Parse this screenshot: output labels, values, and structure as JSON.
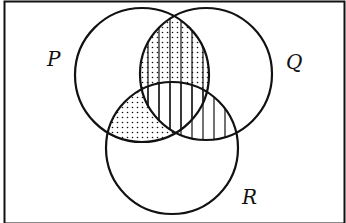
{
  "diagram": {
    "type": "venn",
    "sets": [
      {
        "name": "P",
        "cx": 142,
        "cy": 75,
        "r": 67
      },
      {
        "name": "Q",
        "cx": 206,
        "cy": 74,
        "r": 66
      },
      {
        "name": "R",
        "cx": 172,
        "cy": 148,
        "r": 66
      }
    ],
    "shaded_regions": [
      {
        "region": "P∩Q∩R'",
        "pattern": [
          "dots",
          "vertical-lines"
        ]
      },
      {
        "region": "P∩Q∩R",
        "pattern": [
          "vertical-lines"
        ]
      },
      {
        "region": "P∩R∩Q'",
        "pattern": [
          "dots"
        ]
      },
      {
        "region": "Q∩R∩P'",
        "pattern": [
          "vertical-lines"
        ]
      }
    ],
    "labels": {
      "p": "P",
      "q": "Q",
      "r": "R"
    },
    "colors": {
      "stroke": "#111111",
      "background": "#ffffff"
    }
  }
}
